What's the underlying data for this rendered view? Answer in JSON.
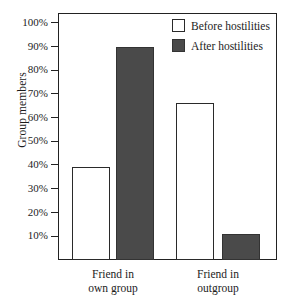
{
  "chart_data": {
    "type": "bar",
    "title": "",
    "xlabel": "",
    "ylabel": "Group members",
    "ylim": [
      0,
      105
    ],
    "grid": false,
    "legend_position": "top-right",
    "categories": [
      "Friend in own group",
      "Friend in outgroup"
    ],
    "category_lines": [
      {
        "line1": "Friend in",
        "line2": "own group"
      },
      {
        "line1": "Friend in",
        "line2": "outgroup"
      }
    ],
    "series": [
      {
        "name": "Before hostilities",
        "color": "#ffffff",
        "values": [
          39,
          66
        ]
      },
      {
        "name": "After hostilities",
        "color": "#4a4a4a",
        "values": [
          90,
          11
        ]
      }
    ],
    "tick_labels": [
      "100%",
      "90%",
      "80%",
      "70%",
      "60%",
      "50%",
      "40%",
      "30%",
      "20%",
      "10%"
    ],
    "tick_values": [
      100,
      90,
      80,
      70,
      60,
      50,
      40,
      30,
      20,
      10
    ]
  },
  "legend": {
    "items": [
      {
        "label": "Before hostilities",
        "swatch": "white-square-swatch"
      },
      {
        "label": "After hostilities",
        "swatch": "dark-square-swatch"
      }
    ]
  },
  "axes": {
    "y_title": "Group members"
  },
  "colors": {
    "before_fill": "#ffffff",
    "after_fill": "#4a4a4a",
    "outline": "#222222",
    "background": "#ffffff"
  }
}
